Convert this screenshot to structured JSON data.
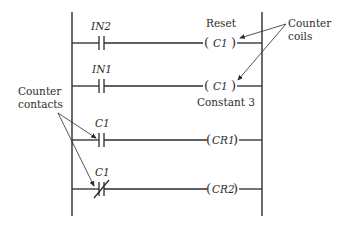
{
  "diagram": {
    "type": "ladder-logic",
    "rungs": [
      {
        "contact": {
          "label": "IN2",
          "type": "normally-open"
        },
        "coil": {
          "label": "C1",
          "above": "Reset"
        }
      },
      {
        "contact": {
          "label": "IN1",
          "type": "normally-open"
        },
        "coil": {
          "label": "C1",
          "below": "Constant 3"
        }
      },
      {
        "contact": {
          "label": "C1",
          "type": "normally-open"
        },
        "coil": {
          "label": "CR1"
        }
      },
      {
        "contact": {
          "label": "C1",
          "type": "normally-closed"
        },
        "coil": {
          "label": "CR2"
        }
      }
    ],
    "annotations": {
      "coils_line1": "Counter",
      "coils_line2": "coils",
      "contacts_line1": "Counter",
      "contacts_line2": "contacts"
    }
  }
}
